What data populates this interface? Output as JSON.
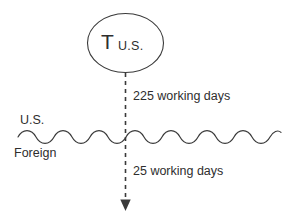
{
  "diagram": {
    "background_color": "#ffffff",
    "stroke_color": "#333333",
    "text_color": "#2e2e2e",
    "node": {
      "shape": "ellipse",
      "main_label": "T",
      "sub_label": "U.S.",
      "cx": 125.5,
      "cy": 43,
      "rx": 38,
      "ry": 29.5
    },
    "boundary": {
      "style": "wavy",
      "above_label": "U.S.",
      "below_label": "Foreign",
      "y": 137,
      "x_start": 18,
      "x_end": 281,
      "amplitude": 4.5,
      "period": 36
    },
    "flow": {
      "style": "dashed-arrow",
      "x": 125.5,
      "y_start": 73,
      "y_end": 210,
      "arrowhead": "down",
      "upper_label": "225 working days",
      "lower_label": "25 working days"
    }
  }
}
